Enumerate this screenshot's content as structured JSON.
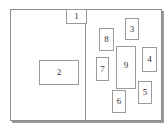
{
  "diagram": {
    "title": "",
    "colors": {
      "border": "#8c8c8c",
      "box_border": "#9a9a9a",
      "shadow": "#9a9a9a",
      "text": "#333333"
    },
    "left_panel": {
      "boxes": [
        {
          "id": "1",
          "label": "1",
          "x": 55,
          "y": -1,
          "w": 21,
          "h": 15
        },
        {
          "id": "2",
          "label": "2",
          "x": 28,
          "y": 50,
          "w": 40,
          "h": 25
        }
      ]
    },
    "right_panel": {
      "boxes": [
        {
          "id": "3",
          "label": "3",
          "x": 114,
          "y": 8,
          "w": 14,
          "h": 22
        },
        {
          "id": "8",
          "label": "8",
          "x": 88,
          "y": 18,
          "w": 15,
          "h": 23
        },
        {
          "id": "9",
          "label": "9",
          "x": 105,
          "y": 36,
          "w": 20,
          "h": 43
        },
        {
          "id": "7",
          "label": "7",
          "x": 85,
          "y": 47,
          "w": 13,
          "h": 24
        },
        {
          "id": "4",
          "label": "4",
          "x": 131,
          "y": 37,
          "w": 15,
          "h": 25
        },
        {
          "id": "5",
          "label": "5",
          "x": 127,
          "y": 71,
          "w": 14,
          "h": 23
        },
        {
          "id": "6",
          "label": "6",
          "x": 101,
          "y": 80,
          "w": 14,
          "h": 23
        }
      ]
    }
  }
}
